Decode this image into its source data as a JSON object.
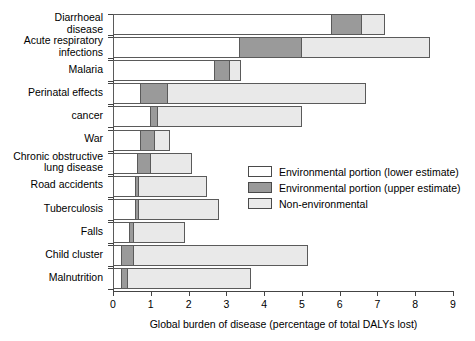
{
  "chart_data": {
    "type": "bar",
    "orientation": "horizontal",
    "stacked": true,
    "title": "",
    "xlabel": "Global burden of disease (percentage of total DALYs lost)",
    "ylabel": "",
    "xlim": [
      0,
      9
    ],
    "xticks": [
      0,
      1,
      2,
      3,
      4,
      5,
      6,
      7,
      8,
      9
    ],
    "xticklabels": [
      "0",
      "1",
      "2",
      "3",
      "4",
      "5",
      "6",
      "7",
      "8",
      "9"
    ],
    "grid": false,
    "legend_position": "center-right",
    "categories": [
      "Diarrhoeal\ndisease",
      "Acute respiratory\ninfections",
      "Malaria",
      "Perinatal effects",
      "cancer",
      "War",
      "Chronic obstructive\nlung disease",
      "Road accidents",
      "Tuberculosis",
      "Falls",
      "Child cluster",
      "Malnutrition"
    ],
    "series": [
      {
        "name": "Environmental portion (lower estimate)",
        "color": "#ffffff",
        "values": [
          5.8,
          3.35,
          2.7,
          0.75,
          1.0,
          0.75,
          0.65,
          0.6,
          0.6,
          0.45,
          0.25,
          0.25
        ]
      },
      {
        "name": "Environmental portion (upper estimate)",
        "color": "#9a9a9a",
        "values": [
          0.8,
          1.65,
          0.4,
          0.7,
          0.2,
          0.35,
          0.35,
          0.1,
          0.1,
          0.1,
          0.3,
          0.15
        ]
      },
      {
        "name": "Non-environmental",
        "color": "#e9e9e9",
        "values": [
          0.6,
          3.4,
          0.3,
          5.25,
          3.8,
          0.4,
          1.1,
          1.8,
          2.1,
          1.35,
          4.6,
          3.25
        ]
      }
    ],
    "totals": [
      7.2,
      8.4,
      3.4,
      6.7,
      5.0,
      1.5,
      2.1,
      2.5,
      2.8,
      1.9,
      5.15,
      3.65
    ]
  },
  "legend": {
    "items": [
      {
        "label": "Environmental portion (lower estimate)",
        "swatch": "#ffffff"
      },
      {
        "label": "Environmental portion (upper estimate)",
        "swatch": "#9a9a9a"
      },
      {
        "label": "Non-environmental",
        "swatch": "#e9e9e9"
      }
    ]
  },
  "axis": {
    "x_title": "Global burden of disease (percentage of total DALYs lost)"
  }
}
